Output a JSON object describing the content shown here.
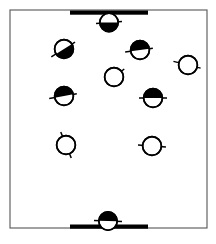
{
  "figure": {
    "width": 216,
    "height": 244,
    "background_color": "#ffffff",
    "ink_color": "#000000",
    "border_color": "#555555"
  },
  "container": {
    "label": "confinement-box",
    "x": 10,
    "y": 10,
    "width": 197,
    "height": 218,
    "stroke_color": "#555555",
    "stroke_width": 1.1,
    "fill_color": "#ffffff"
  },
  "walls": [
    {
      "label": "top-wall",
      "x": 70,
      "y": 10.5,
      "width": 78,
      "height": 4.2,
      "color": "#000000"
    },
    {
      "label": "bottom-wall",
      "x": 70,
      "y": 224.5,
      "width": 78,
      "height": 4.2,
      "color": "#000000"
    }
  ],
  "particles": [
    {
      "id": "particle-top-wall",
      "cx": 109,
      "cy": 22.5,
      "r": 9.2,
      "fill_style": "half",
      "cap_side": "upper",
      "cap_angle": 0,
      "axis_angle": -4,
      "axis_left": 13,
      "axis_right": 13,
      "adsorbed": "top-wall"
    },
    {
      "id": "particle-upper-left",
      "cx": 64,
      "cy": 49,
      "r": 9.4,
      "fill_style": "half",
      "cap_side": "upper",
      "cap_angle": -32,
      "axis_angle": -32,
      "axis_left": 15,
      "axis_right": 13,
      "adsorbed": null
    },
    {
      "id": "particle-upper-right",
      "cx": 140,
      "cy": 50,
      "r": 9.4,
      "fill_style": "half",
      "cap_side": "lower",
      "cap_angle": -8,
      "axis_angle": -8,
      "axis_left": 15,
      "axis_right": 13,
      "adsorbed": null
    },
    {
      "id": "particle-right-edge",
      "cx": 188,
      "cy": 65,
      "r": 9.4,
      "fill_style": "empty",
      "cap_side": null,
      "cap_angle": 0,
      "axis_angle": 14,
      "axis_left": 15,
      "axis_right": 13,
      "adsorbed": null
    },
    {
      "id": "particle-center",
      "cx": 114,
      "cy": 77,
      "r": 9.4,
      "fill_style": "empty",
      "cap_side": null,
      "cap_angle": 0,
      "axis_angle": -38,
      "axis_left": 0,
      "axis_right": 13,
      "adsorbed": null
    },
    {
      "id": "particle-mid-left",
      "cx": 64,
      "cy": 96,
      "r": 9.4,
      "fill_style": "half",
      "cap_side": "lower",
      "cap_angle": -10,
      "axis_angle": -10,
      "axis_left": 15,
      "axis_right": 13,
      "adsorbed": null
    },
    {
      "id": "particle-mid-right",
      "cx": 153,
      "cy": 98,
      "r": 9.4,
      "fill_style": "half",
      "cap_side": "lower",
      "cap_angle": 0,
      "axis_angle": 0,
      "axis_left": 14,
      "axis_right": 14,
      "adsorbed": null
    },
    {
      "id": "particle-lower-left",
      "cx": 66,
      "cy": 145,
      "r": 9.4,
      "fill_style": "empty",
      "cap_side": null,
      "cap_angle": 0,
      "axis_angle": 68,
      "axis_left": 14,
      "axis_right": 14,
      "adsorbed": null
    },
    {
      "id": "particle-lower-right",
      "cx": 152,
      "cy": 146,
      "r": 9.4,
      "fill_style": "empty",
      "cap_side": null,
      "cap_angle": 0,
      "axis_angle": 4,
      "axis_left": 14,
      "axis_right": 14,
      "adsorbed": null
    },
    {
      "id": "particle-bottom-wall",
      "cx": 108,
      "cy": 221,
      "r": 9.2,
      "fill_style": "half",
      "cap_side": "lower",
      "cap_angle": 2,
      "axis_angle": 2,
      "axis_left": 14,
      "axis_right": 14,
      "adsorbed": "bottom-wall"
    }
  ]
}
